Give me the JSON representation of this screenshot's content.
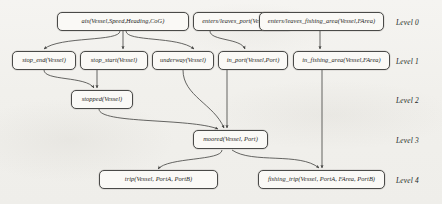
{
  "diagram": {
    "stroke_color": "#4a4a48",
    "node_fill": "#faf9f6",
    "background": "#f3f2ef",
    "levels": [
      {
        "id": "level-0",
        "label": "Level 0"
      },
      {
        "id": "level-1",
        "label": "Level 1"
      },
      {
        "id": "level-2",
        "label": "Level 2"
      },
      {
        "id": "level-3",
        "label": "Level 3"
      },
      {
        "id": "level-4",
        "label": "Level 4"
      }
    ],
    "nodes": [
      {
        "id": "ais",
        "label": "ais(Vessel,Speed,Heading,CoG)",
        "level": 0
      },
      {
        "id": "enters_port",
        "label": "enters/leaves_port(Vessel,Port)",
        "level": 0
      },
      {
        "id": "enters_fishing",
        "label": "enters/leaves_fishing_area(Vessel,FArea)",
        "level": 0
      },
      {
        "id": "stop_end",
        "label": "stop_end(Vessel)",
        "level": 1
      },
      {
        "id": "stop_start",
        "label": "stop_start(Vessel)",
        "level": 1
      },
      {
        "id": "underway",
        "label": "underway(Vessel)",
        "level": 1
      },
      {
        "id": "in_port",
        "label": "in_port(Vessel,Port)",
        "level": 1
      },
      {
        "id": "in_fishing_area",
        "label": "in_fishing_area(Vessel,FArea)",
        "level": 1
      },
      {
        "id": "stopped",
        "label": "stopped(Vessel)",
        "level": 2
      },
      {
        "id": "moored",
        "label": "moored(Vessel, Port)",
        "level": 3
      },
      {
        "id": "trip",
        "label": "trip(Vessel, PortA, PortB)",
        "level": 4
      },
      {
        "id": "fishing_trip",
        "label": "fishing_trip(Vessel, PortA, FArea, PortB)",
        "level": 4
      }
    ],
    "edges": [
      {
        "from": "ais",
        "to": "stop_end"
      },
      {
        "from": "ais",
        "to": "stop_start"
      },
      {
        "from": "ais",
        "to": "underway"
      },
      {
        "from": "enters_port",
        "to": "in_port"
      },
      {
        "from": "enters_fishing",
        "to": "in_fishing_area"
      },
      {
        "from": "stop_end",
        "to": "stopped"
      },
      {
        "from": "stop_start",
        "to": "stopped"
      },
      {
        "from": "underway",
        "to": "moored"
      },
      {
        "from": "in_port",
        "to": "moored"
      },
      {
        "from": "stopped",
        "to": "moored"
      },
      {
        "from": "moored",
        "to": "trip"
      },
      {
        "from": "moored",
        "to": "fishing_trip"
      },
      {
        "from": "in_fishing_area",
        "to": "fishing_trip"
      }
    ]
  }
}
